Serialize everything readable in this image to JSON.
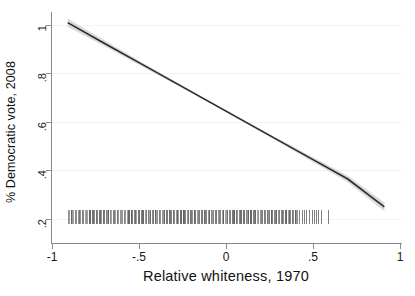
{
  "chart_data": {
    "type": "line",
    "title": "",
    "xlabel": "Relative  whiteness, 1970",
    "ylabel": "% Democratic vote, 2008",
    "xlim": [
      -1,
      1
    ],
    "ylim": [
      0.17,
      1.05
    ],
    "grid": true,
    "legend": null,
    "xticks": [
      -1,
      -0.5,
      0,
      0.5,
      1
    ],
    "xtick_labels": [
      "-1",
      "-.5",
      "0",
      ".5",
      "1"
    ],
    "yticks": [
      0.2,
      0.4,
      0.6,
      0.8,
      1.0
    ],
    "ytick_labels": [
      ".2",
      ".4",
      ".6",
      ".8",
      "1"
    ],
    "series": [
      {
        "name": "Fitted linear prediction",
        "type": "line",
        "color": "#2b2b2b",
        "x": [
          -0.91,
          -0.7,
          -0.5,
          -0.25,
          0,
          0.25,
          0.5,
          0.7,
          0.91
        ],
        "values": [
          1.01,
          0.925,
          0.845,
          0.745,
          0.645,
          0.545,
          0.445,
          0.365,
          0.25
        ]
      },
      {
        "name": "95% confidence interval",
        "type": "band",
        "color": "#d9d9d9",
        "x": [
          -0.91,
          -0.7,
          -0.5,
          -0.25,
          0,
          0.25,
          0.5,
          0.7,
          0.91
        ],
        "lower": [
          0.993,
          0.913,
          0.836,
          0.739,
          0.64,
          0.539,
          0.435,
          0.352,
          0.232
        ],
        "upper": [
          1.027,
          0.937,
          0.854,
          0.751,
          0.65,
          0.551,
          0.455,
          0.378,
          0.268
        ]
      },
      {
        "name": "Observation rug (marginal distribution of x)",
        "type": "rug",
        "color": "#5f5f5f",
        "y": 0.2,
        "dense_range": [
          -0.91,
          0.42
        ],
        "sparse_x": [
          0.435,
          0.448,
          0.462,
          0.478,
          0.492,
          0.505,
          0.515,
          0.528,
          0.545,
          0.585
        ]
      }
    ],
    "annotations": []
  },
  "axes": {
    "y_title": "% Democratic vote, 2008",
    "x_title": "Relative  whiteness, 1970"
  },
  "colors": {
    "line": "#2b2b2b",
    "band": "#d9d9d9",
    "rug": "#5f5f5f",
    "axis": "#8a8a8a",
    "grid": "#f2f2f2",
    "background": "#ffffff"
  }
}
